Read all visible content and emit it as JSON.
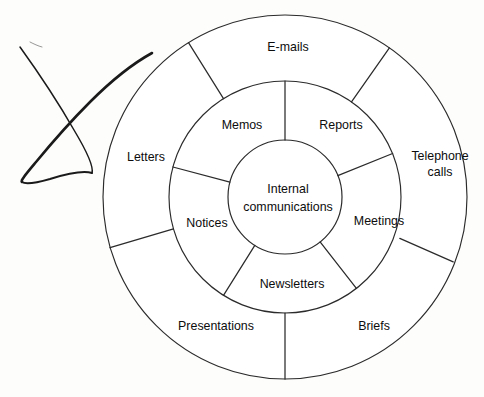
{
  "diagram": {
    "title": "Internal communications",
    "type": "concentric-ring-wheel",
    "centre": {
      "label_line1": "Internal",
      "label_line2": "communications"
    },
    "middle_ring": {
      "segment_count": 6,
      "segments": [
        {
          "label": "Memos"
        },
        {
          "label": "Reports"
        },
        {
          "label": "Meetings"
        },
        {
          "label": "Newsletters"
        },
        {
          "label": "Notices"
        }
      ]
    },
    "outer_ring": {
      "segment_count": 5,
      "segments": [
        {
          "label": "E-mails"
        },
        {
          "label_line1": "Telephone",
          "label_line2": "calls"
        },
        {
          "label": "Briefs"
        },
        {
          "label": "Presentations"
        },
        {
          "label": "Letters"
        }
      ]
    },
    "annotation": {
      "name": "ink-pen-mark",
      "description": "handwritten ink loop"
    },
    "colors": {
      "stroke": "#2b2b2b",
      "text": "#0d0d0d",
      "background": "#fdfdfc",
      "ink": "#1a1a1a"
    }
  }
}
